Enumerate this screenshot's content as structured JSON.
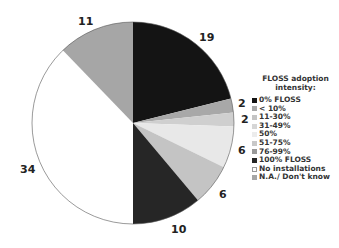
{
  "chart_data": {
    "type": "pie",
    "title": "",
    "legend_title": "FLOSS adoption intensity:",
    "legend_position": "right",
    "start_angle": "12 o'clock",
    "direction": "clockwise",
    "series": [
      {
        "name": "0% FLOSS",
        "value": 19,
        "color": "#141414",
        "label": "19"
      },
      {
        "name": "< 10%",
        "value": 2,
        "color": "#a8a8a8",
        "label": "2"
      },
      {
        "name": "11-30%",
        "value": 2,
        "color": "#cfcfcf",
        "label": "2"
      },
      {
        "name": "31-49%",
        "value": 6,
        "color": "#e8e8e8",
        "label": "6"
      },
      {
        "name": "50%",
        "value": 0,
        "color": "#f2f2f2",
        "label": ""
      },
      {
        "name": "51-75%",
        "value": 6,
        "color": "#c4c4c4",
        "label": "6"
      },
      {
        "name": "76-99%",
        "value": 0,
        "color": "#999999",
        "label": ""
      },
      {
        "name": "100% FLOSS",
        "value": 10,
        "color": "#262626",
        "label": "10"
      },
      {
        "name": "No installations",
        "value": 34,
        "color": "#ffffff",
        "label": "34"
      },
      {
        "name": "N.A./ Don't know",
        "value": 11,
        "color": "#a6a6a6",
        "label": "11"
      }
    ],
    "total": 90
  },
  "legend": {
    "title_line1": "FLOSS adoption",
    "title_line2": "intensity:",
    "items": [
      {
        "label": "0% FLOSS",
        "color": "#141414"
      },
      {
        "label": "< 10%",
        "color": "#a8a8a8"
      },
      {
        "label": "11-30%",
        "color": "#c4c4c4"
      },
      {
        "label": "31-49%",
        "color": "#d6d6d6"
      },
      {
        "label": "50%",
        "color": "#ececec"
      },
      {
        "label": "51-75%",
        "color": "#c8c8c8"
      },
      {
        "label": "76-99%",
        "color": "#999999"
      },
      {
        "label": "100% FLOSS",
        "color": "#262626"
      },
      {
        "label": "No installations",
        "color": "#ffffff"
      },
      {
        "label": "N.A./ Don't know",
        "color": "#a6a6a6"
      }
    ]
  },
  "labels": {
    "l19": "19",
    "l2a": "2",
    "l2b": "2",
    "l6a": "6",
    "l6b": "6",
    "l10": "10",
    "l34": "34",
    "l11": "11"
  }
}
